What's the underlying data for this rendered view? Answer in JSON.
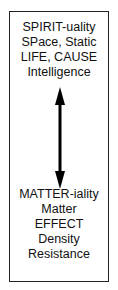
{
  "diagram": {
    "top_labels": [
      "SPIRIT-uality",
      "SPace, Static",
      "LIFE, CAUSE",
      "Intelligence"
    ],
    "bottom_labels": [
      "MATTER-iality",
      "Matter",
      "EFFECT",
      "Density",
      "Resistance"
    ],
    "connector": "double-headed-vertical-arrow",
    "colors": {
      "border": "#222222",
      "text": "#111111",
      "arrow": "#000000"
    }
  }
}
